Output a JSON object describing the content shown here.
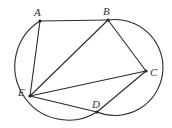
{
  "diagram": {
    "title": "",
    "points": [
      {
        "name": "A",
        "x": 40,
        "y": 21,
        "label_x": 34,
        "label_y": 16
      },
      {
        "name": "B",
        "x": 108,
        "y": 20,
        "label_x": 103,
        "label_y": 15
      },
      {
        "name": "C",
        "x": 146,
        "y": 71,
        "label_x": 150,
        "label_y": 76
      },
      {
        "name": "D",
        "x": 97,
        "y": 112,
        "label_x": 92,
        "label_y": 108
      },
      {
        "name": "E",
        "x": 30,
        "y": 96,
        "label_x": 18,
        "label_y": 96
      }
    ],
    "segments": [
      [
        "A",
        "B"
      ],
      [
        "A",
        "E"
      ],
      [
        "B",
        "E"
      ],
      [
        "B",
        "C"
      ],
      [
        "C",
        "E"
      ],
      [
        "C",
        "D"
      ],
      [
        "E",
        "D"
      ]
    ],
    "arcs": [
      {
        "name": "left-arc",
        "from": "A",
        "to": "D",
        "cx": 62,
        "cy": 70,
        "r": 53
      },
      {
        "name": "right-arc",
        "from": "D",
        "to": "B",
        "cx": 118,
        "cy": 67,
        "r": 48
      }
    ],
    "colors": {
      "stroke": "#2a2a2a",
      "background": "#ffffff"
    }
  }
}
